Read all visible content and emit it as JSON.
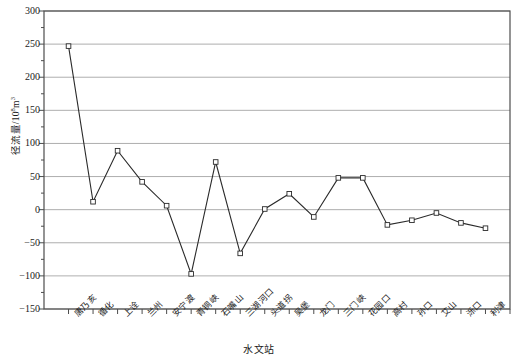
{
  "chart_data": {
    "type": "line",
    "title": "",
    "xlabel": "水文站",
    "ylabel": "径流量/10⁸m³",
    "ylabel_main": "径流量/10",
    "ylabel_sup": "8",
    "ylabel_unit": "m",
    "ylabel_unit_sup": "3",
    "ylim": [
      -150,
      300
    ],
    "ytick_step": 50,
    "yticks": [
      300,
      250,
      200,
      150,
      100,
      50,
      0,
      -50,
      -100,
      -150
    ],
    "ytick_labels": [
      "300",
      "250",
      "200",
      "150",
      "100",
      "50",
      "0",
      "−50",
      "−100",
      "−150"
    ],
    "minor_ticks": true,
    "minor_tick_step": 25,
    "grid": true,
    "grid_axis": "y",
    "legend": "none",
    "marker": "open-square",
    "line_color": "#2a2a2a",
    "marker_color": "#ffffff",
    "marker_edge_color": "#2a2a2a",
    "grid_color": "#999999",
    "axis_color": "#4d4d4d",
    "categories": [
      "唐乃亥",
      "循化",
      "上诠",
      "兰州",
      "安宁渡",
      "青铜峡",
      "石嘴山",
      "三湖河口",
      "头道拐",
      "吴堡",
      "龙门",
      "三门峡",
      "花园口",
      "高村",
      "孙口",
      "艾山",
      "泺口",
      "利津"
    ],
    "values": [
      247,
      12,
      89,
      42,
      6,
      -97,
      72,
      -66,
      1,
      24,
      -11,
      48,
      48,
      -23,
      -16,
      -5,
      -20,
      -28
    ],
    "series": [
      {
        "name": "径流量",
        "values": [
          247,
          12,
          89,
          42,
          6,
          -97,
          72,
          -66,
          1,
          24,
          -11,
          48,
          48,
          -23,
          -16,
          -5,
          -20,
          -28
        ]
      }
    ]
  },
  "figure": {
    "background": "#ffffff",
    "plot_background": "#ffffff"
  }
}
